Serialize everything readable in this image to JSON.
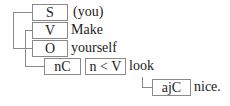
{
  "diagram": {
    "type": "sentence-structure",
    "nodes": [
      {
        "id": "s",
        "label": "S",
        "word": "(you)"
      },
      {
        "id": "v",
        "label": "V",
        "word": "Make"
      },
      {
        "id": "o",
        "label": "O",
        "word": "yourself"
      },
      {
        "id": "nc",
        "label": "nC"
      },
      {
        "id": "nv",
        "label": "n < V",
        "word": "look"
      },
      {
        "id": "ajc",
        "label": "ajC",
        "word": "nice."
      }
    ]
  }
}
